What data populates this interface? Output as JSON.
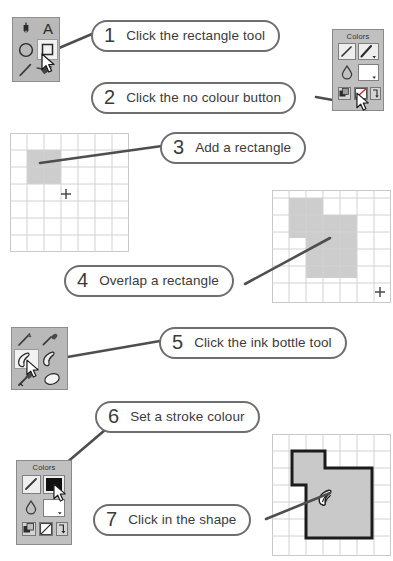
{
  "document": {
    "title": "Drawing tutorial: combine shapes with the ink bottle tool",
    "background_color": "#ffffff"
  },
  "steps": [
    {
      "number": "1",
      "text": "Click the rectangle tool"
    },
    {
      "number": "2",
      "text": "Click the no colour button"
    },
    {
      "number": "3",
      "text": "Add a rectangle"
    },
    {
      "number": "4",
      "text": "Overlap a rectangle"
    },
    {
      "number": "5",
      "text": "Click the ink bottle tool"
    },
    {
      "number": "6",
      "text": "Set a stroke colour"
    },
    {
      "number": "7",
      "text": "Click in the shape"
    }
  ],
  "palettes": {
    "shape_tools": {
      "name": "shape-tool-palette",
      "background_color": "#b9b9b9",
      "tools": [
        {
          "name": "pen-nib-tool",
          "label": "Pen"
        },
        {
          "name": "text-tool",
          "label": "A"
        },
        {
          "name": "ellipse-tool",
          "label": "Ellipse"
        },
        {
          "name": "rectangle-tool",
          "label": "Rectangle",
          "selected": true
        },
        {
          "name": "line-tool",
          "label": "Line"
        },
        {
          "name": "paint-bucket-tool",
          "label": "Paint bucket"
        }
      ],
      "cursor": "arrow-cursor"
    },
    "paint_tools": {
      "name": "paint-tool-palette",
      "background_color": "#b9b9b9",
      "tools": [
        {
          "name": "pencil-tool",
          "label": "Pencil"
        },
        {
          "name": "brush-tool",
          "label": "Brush"
        },
        {
          "name": "ink-bottle-tool",
          "label": "Ink bottle",
          "selected": true
        },
        {
          "name": "paint-bucket-tool",
          "label": "Paint bucket"
        },
        {
          "name": "eyedropper-tool",
          "label": "Eyedropper"
        },
        {
          "name": "eraser-tool",
          "label": "Eraser"
        }
      ],
      "cursor": "arrow-cursor"
    }
  },
  "colors_panels": {
    "top": {
      "title": "Colors",
      "stroke_swatch_color": "#ffffff",
      "fill_swatch_color": "#ffffff",
      "buttons": [
        {
          "name": "default-colors-button"
        },
        {
          "name": "no-colour-button",
          "active": true
        },
        {
          "name": "swap-colors-button"
        }
      ],
      "cursor": "arrow-cursor"
    },
    "bottom": {
      "title": "Colors",
      "stroke_swatch_color": "#111111",
      "fill_swatch_color": "#ffffff",
      "buttons": [
        {
          "name": "default-colors-button"
        },
        {
          "name": "no-colour-button"
        },
        {
          "name": "swap-colors-button"
        }
      ],
      "cursor": "arrow-cursor"
    }
  },
  "canvases": [
    {
      "name": "canvas-single-rectangle",
      "grid": {
        "cols": 7,
        "rows": 7,
        "line_color": "#cfcfcf"
      },
      "fill_color": "#cccccc",
      "shapes": [
        {
          "name": "rectangle-1",
          "col": 1,
          "row": 1,
          "w": 2,
          "h": 2
        }
      ],
      "crosshair": {
        "col": 2.6,
        "row": 3.3,
        "glyph": "+"
      }
    },
    {
      "name": "canvas-overlapping-rectangles",
      "grid": {
        "cols": 7,
        "rows": 7,
        "line_color": "#cfcfcf"
      },
      "fill_color": "#cccccc",
      "shapes": [
        {
          "name": "rectangle-1",
          "col": 1,
          "row": 0.6,
          "w": 2,
          "h": 2.4
        },
        {
          "name": "rectangle-2",
          "col": 2,
          "row": 1.6,
          "w": 3.2,
          "h": 3.4
        }
      ],
      "crosshair": {
        "col": 6.1,
        "row": 6.1,
        "glyph": "+"
      }
    },
    {
      "name": "canvas-stroked-shape",
      "grid": {
        "cols": 7,
        "rows": 7,
        "line_color": "#cfcfcf"
      },
      "fill_color": "#c9c9c9",
      "stroke_color": "#1b1b1b",
      "stroke_width": 3,
      "shapes": [
        {
          "name": "merged-shape",
          "outline": "union of two rectangles"
        }
      ],
      "cursor": "ink-bottle-cursor"
    }
  ],
  "colors": {
    "callout_border": "#6e6e6e",
    "leader_line": "#4e4e4e",
    "palette_gray": "#b9b9b9",
    "shape_fill": "#cccccc",
    "stroke_black": "#1b1b1b"
  }
}
